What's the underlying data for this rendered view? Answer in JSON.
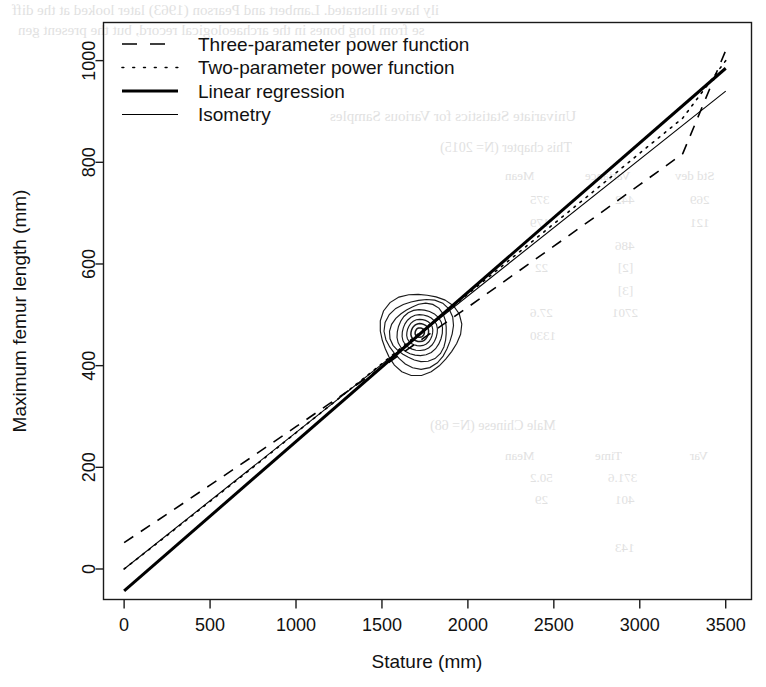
{
  "chart_data": {
    "type": "line",
    "title": "",
    "xlabel": "Stature (mm)",
    "ylabel": "Maximum femur length (mm)",
    "xlim": [
      -120,
      3650
    ],
    "ylim": [
      -60,
      1075
    ],
    "xticks": [
      0,
      500,
      1000,
      1500,
      2000,
      2500,
      3000,
      3500
    ],
    "yticks": [
      0,
      200,
      400,
      600,
      800,
      1000
    ],
    "grid": false,
    "legend_position": "top-left-inside",
    "series": [
      {
        "name": "Three-parameter power function",
        "style": "dashed",
        "linewidth": 1.6,
        "color": "#000000",
        "x": [
          0,
          250,
          500,
          750,
          1000,
          1250,
          1500,
          1750,
          2000,
          2250,
          2500,
          2750,
          3000,
          3250,
          3500
        ],
        "y": [
          52,
          108,
          165,
          222,
          280,
          338,
          397,
          456,
          515,
          575,
          635,
          695,
          756,
          817,
          1020
        ]
      },
      {
        "name": "Two-parameter power function",
        "style": "dotted",
        "linewidth": 1.6,
        "color": "#000000",
        "x": [
          0,
          250,
          500,
          750,
          1000,
          1250,
          1500,
          1750,
          2000,
          2250,
          2500,
          2750,
          3000,
          3250,
          3500
        ],
        "y": [
          0,
          66,
          133,
          200,
          268,
          336,
          404,
          473,
          541,
          610,
          679,
          748,
          818,
          887,
          1000
        ]
      },
      {
        "name": "Linear regression",
        "style": "solid",
        "linewidth": 3.0,
        "color": "#000000",
        "x": [
          0,
          3500
        ],
        "y": [
          -43,
          985
        ],
        "x_intercept": 146
      },
      {
        "name": "Isometry",
        "style": "solid",
        "linewidth": 1.1,
        "color": "#000000",
        "x": [
          0,
          3500
        ],
        "y": [
          0,
          940
        ]
      }
    ],
    "density_contours": {
      "description": "Nested bivariate density contours of the sample",
      "center_x": 1720,
      "center_y": 465,
      "tilt_deg": -52,
      "levels": 8,
      "semi_major_mm": [
        240,
        205,
        170,
        138,
        108,
        80,
        54,
        28
      ],
      "semi_minor_mm": [
        78,
        66,
        55,
        44,
        34,
        25,
        17,
        9
      ]
    }
  },
  "legend": {
    "items": [
      {
        "label": "Three-parameter power function",
        "sample": "dashed-line-sample"
      },
      {
        "label": "Two-parameter power function",
        "sample": "dotted-line-sample"
      },
      {
        "label": "Linear regression",
        "sample": "thick-solid-line-sample"
      },
      {
        "label": "Isometry",
        "sample": "thin-solid-line-sample"
      }
    ]
  },
  "axes": {
    "x_label": "Stature (mm)",
    "y_label": "Maximum femur length (mm)",
    "x_tick_labels": [
      "0",
      "500",
      "1000",
      "1500",
      "2000",
      "2500",
      "3000",
      "3500"
    ],
    "y_tick_labels": [
      "0",
      "200",
      "400",
      "600",
      "800",
      "1000"
    ]
  },
  "background_showthrough": {
    "note": "Faint mirrored text bleeding through from the reverse side of the scanned page",
    "lines": [
      {
        "text": "ily have illustrated. Lambert and Pearson (1963) later looked at the diff",
        "x": 12,
        "y": 2,
        "size": 15
      },
      {
        "text": "se from long bones in the archaeological record, but the present gen",
        "x": 18,
        "y": 22,
        "size": 15
      },
      {
        "text": "Univariate Statistics for Various Samples",
        "x": 330,
        "y": 108,
        "size": 15
      },
      {
        "text": "This chapter (N= 2015)",
        "x": 440,
        "y": 140,
        "size": 14
      },
      {
        "text": "Mean",
        "x": 505,
        "y": 168,
        "size": 13
      },
      {
        "text": "Variance",
        "x": 585,
        "y": 168,
        "size": 13
      },
      {
        "text": "Std dev",
        "x": 675,
        "y": 168,
        "size": 13
      },
      {
        "text": "375",
        "x": 530,
        "y": 192,
        "size": 13
      },
      {
        "text": "442",
        "x": 615,
        "y": 192,
        "size": 13
      },
      {
        "text": "269",
        "x": 690,
        "y": 192,
        "size": 13
      },
      {
        "text": "179",
        "x": 530,
        "y": 215,
        "size": 13
      },
      {
        "text": "121",
        "x": 690,
        "y": 215,
        "size": 13
      },
      {
        "text": "486",
        "x": 615,
        "y": 238,
        "size": 13
      },
      {
        "text": "22",
        "x": 535,
        "y": 260,
        "size": 13
      },
      {
        "text": "[2]",
        "x": 618,
        "y": 260,
        "size": 13
      },
      {
        "text": "[3]",
        "x": 618,
        "y": 283,
        "size": 13
      },
      {
        "text": "27.6",
        "x": 530,
        "y": 305,
        "size": 13
      },
      {
        "text": "2701",
        "x": 612,
        "y": 305,
        "size": 13
      },
      {
        "text": "1330",
        "x": 530,
        "y": 328,
        "size": 13
      },
      {
        "text": "Male Chinese (N= 68)",
        "x": 430,
        "y": 418,
        "size": 14
      },
      {
        "text": "Mean",
        "x": 505,
        "y": 448,
        "size": 13
      },
      {
        "text": "Time",
        "x": 595,
        "y": 448,
        "size": 13
      },
      {
        "text": "Var",
        "x": 690,
        "y": 448,
        "size": 13
      },
      {
        "text": "50.2",
        "x": 530,
        "y": 470,
        "size": 13
      },
      {
        "text": "371.6",
        "x": 608,
        "y": 470,
        "size": 13
      },
      {
        "text": "29",
        "x": 535,
        "y": 492,
        "size": 13
      },
      {
        "text": "401",
        "x": 615,
        "y": 492,
        "size": 13
      },
      {
        "text": "143",
        "x": 615,
        "y": 540,
        "size": 13
      }
    ]
  }
}
